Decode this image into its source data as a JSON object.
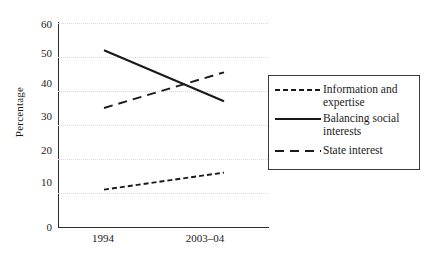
{
  "chart_data": {
    "type": "line",
    "title": "",
    "xlabel": "",
    "ylabel": "Percentage",
    "x": [
      "1994",
      "2003–04"
    ],
    "categories": [
      "1994",
      "2003–04"
    ],
    "ylim": [
      0,
      60
    ],
    "xlim": [
      0,
      1
    ],
    "y_ticks": [
      0,
      10,
      20,
      30,
      40,
      50,
      60
    ],
    "y_tick_labels": [
      "0",
      "10",
      "20",
      "30",
      "40",
      "50",
      "60"
    ],
    "x_tick_labels": [
      "1994",
      "2003–04"
    ],
    "grid": "horizontal-dotted",
    "legend_position": "right",
    "series": [
      {
        "name": "Information and expertise",
        "style": "short-dashed",
        "color": "#1a1a1a",
        "values": [
          11,
          16
        ]
      },
      {
        "name": "Balancing social interests",
        "style": "solid",
        "color": "#1a1a1a",
        "values": [
          52,
          37
        ]
      },
      {
        "name": "State interest",
        "style": "long-dashed",
        "color": "#1a1a1a",
        "values": [
          35,
          45.5
        ]
      }
    ]
  },
  "axes": {
    "y_title": "Percentage",
    "y_tick_labels": [
      "60",
      "50",
      "40",
      "30",
      "20",
      "10",
      "0"
    ],
    "x_tick_labels": [
      "1994",
      "2003–04"
    ]
  },
  "legend": {
    "entries": [
      {
        "label_line1": "Information and",
        "label_line2": "expertise",
        "swatch": "dashed-short-line-icon"
      },
      {
        "label_line1": "Balancing social",
        "label_line2": "interests",
        "swatch": "solid-line-icon"
      },
      {
        "label_line1": "State interest",
        "label_line2": "",
        "swatch": "dashed-long-line-icon"
      }
    ]
  },
  "colors": {
    "ink": "#1a1a1a",
    "axis": "#2b2b2b",
    "grid": "#d8d8dd",
    "background": "#ffffff"
  }
}
